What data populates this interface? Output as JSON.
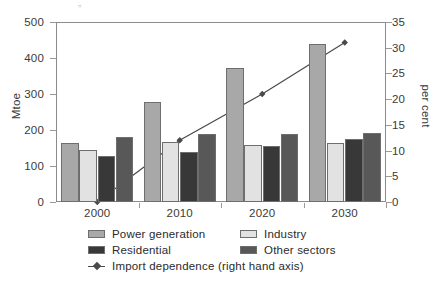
{
  "chart_data": {
    "type": "bar",
    "title": "",
    "subtitle": "",
    "xlabel": "",
    "ylabel": "Mtoe",
    "ylabel_right": "per cent",
    "categories": [
      "2000",
      "2010",
      "2020",
      "2030"
    ],
    "ylim": [
      0,
      500
    ],
    "ylim_right": [
      0,
      35
    ],
    "yticks": [
      0,
      100,
      200,
      300,
      400,
      500
    ],
    "yticks_right": [
      0,
      5,
      10,
      15,
      20,
      25,
      30,
      35
    ],
    "ytick_labels": [
      "0",
      "100",
      "200",
      "300",
      "400",
      "500"
    ],
    "ytick_labels_right": [
      "0",
      "5",
      "10",
      "15",
      "20",
      "25",
      "30",
      "35"
    ],
    "grid": false,
    "legend_position": "bottom",
    "series": [
      {
        "name": "Power generation",
        "kind": "bar",
        "axis": "left",
        "color": "#a8a8a8",
        "values": [
          163,
          278,
          373,
          440
        ]
      },
      {
        "name": "Industry",
        "kind": "bar",
        "axis": "left",
        "color": "#e2e2e2",
        "values": [
          145,
          167,
          158,
          163
        ]
      },
      {
        "name": "Residential",
        "kind": "bar",
        "axis": "left",
        "color": "#383838",
        "values": [
          128,
          140,
          155,
          175
        ]
      },
      {
        "name": "Other sectors",
        "kind": "bar",
        "axis": "left",
        "color": "#585858",
        "values": [
          180,
          188,
          190,
          193
        ]
      },
      {
        "name": "Import dependence (right hand axis)",
        "kind": "line",
        "axis": "right",
        "color": "#4a4a4a",
        "marker": "diamond",
        "values": [
          0,
          12,
          21,
          31
        ]
      }
    ]
  },
  "legend": {
    "entries": [
      {
        "label": "Power generation",
        "swatch": "#a8a8a8",
        "type": "swatch"
      },
      {
        "label": "Industry",
        "swatch": "#e2e2e2",
        "type": "swatch"
      },
      {
        "label": "Residential",
        "swatch": "#383838",
        "type": "swatch"
      },
      {
        "label": "Other sectors",
        "swatch": "#585858",
        "type": "swatch"
      },
      {
        "label": "Import dependence (right hand axis)",
        "swatch": "#4a4a4a",
        "type": "line-marker"
      }
    ]
  },
  "axes": {
    "left_label": "Mtoe",
    "right_label": "per cent"
  }
}
